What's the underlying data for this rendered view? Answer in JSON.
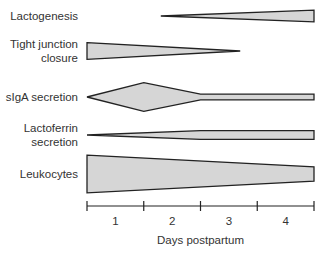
{
  "chart_data": {
    "type": "timeline-profile",
    "xlabel": "Days postpartum",
    "x_range": [
      0,
      4
    ],
    "ticks": [
      0,
      1,
      2,
      3,
      4
    ],
    "tick_labels": [
      {
        "label": "1",
        "at": 0.5
      },
      {
        "label": "2",
        "at": 1.5
      },
      {
        "label": "3",
        "at": 2.5
      },
      {
        "label": "4",
        "at": 3.5
      }
    ],
    "rows": [
      {
        "name": "Lactogenesis",
        "label_lines": [
          "Lactogenesis"
        ],
        "profile": [
          [
            1.3,
            0.0
          ],
          [
            4.0,
            0.45
          ]
        ]
      },
      {
        "name": "Tight junction closure",
        "label_lines": [
          "Tight junction",
          "closure"
        ],
        "profile": [
          [
            0.0,
            0.65
          ],
          [
            2.7,
            0.0
          ]
        ]
      },
      {
        "name": "sIgA secretion",
        "label_lines": [
          "sIgA secretion"
        ],
        "profile": [
          [
            0.0,
            0.0
          ],
          [
            1.0,
            1.1
          ],
          [
            2.0,
            0.22
          ],
          [
            4.0,
            0.22
          ]
        ]
      },
      {
        "name": "Lactoferrin secretion",
        "label_lines": [
          "Lactoferrin",
          "secretion"
        ],
        "profile": [
          [
            0.0,
            0.0
          ],
          [
            2.0,
            0.33
          ],
          [
            4.0,
            0.33
          ]
        ]
      },
      {
        "name": "Leukocytes",
        "label_lines": [
          "Leukocytes"
        ],
        "profile": [
          [
            0.0,
            1.05
          ],
          [
            4.0,
            0.4
          ]
        ]
      }
    ]
  }
}
